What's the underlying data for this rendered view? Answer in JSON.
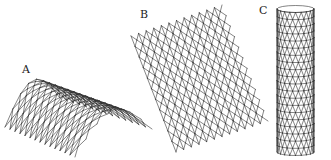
{
  "figure": {
    "background": "#ffffff",
    "stroke_color": "#333333",
    "panels": [
      {
        "label": "A",
        "label_pos": [
          22,
          64
        ],
        "description": "curved arch-shaped diamond lattice mesh",
        "type": "arch",
        "front_left": [
          5,
          127
        ],
        "front_right": [
          75,
          157
        ],
        "back_left": [
          60,
          98
        ],
        "back_right": [
          152,
          129
        ],
        "arch_height": 32,
        "rows": 14,
        "cols": 7
      },
      {
        "label": "B",
        "label_pos": [
          140,
          9
        ],
        "description": "flat diamond lattice sheet",
        "type": "sheet",
        "corners": [
          [
            131,
            36
          ],
          [
            222,
            5
          ],
          [
            268,
            121
          ],
          [
            176,
            152
          ]
        ],
        "rows": 11,
        "cols": 12
      },
      {
        "label": "C",
        "label_pos": [
          259,
          5
        ],
        "description": "cylindrical triangulated tube mesh",
        "type": "cylinder",
        "left": 277,
        "right": 314,
        "top": 9,
        "bottom": 152,
        "rings": 20,
        "segments": 10
      }
    ]
  }
}
